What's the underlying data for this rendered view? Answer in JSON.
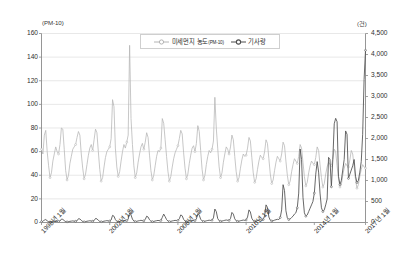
{
  "axes": {
    "left_unit": "(PM-10)",
    "right_unit": "(건)",
    "left_ticks": [
      "160",
      "140",
      "120",
      "100",
      "80",
      "60",
      "40",
      "20",
      "0"
    ],
    "right_ticks": [
      "4,500",
      "4,000",
      "3,500",
      "3,000",
      "2,500",
      "2,000",
      "1,500",
      "1,000",
      "500",
      "0"
    ],
    "x_ticks": [
      "1998년 1월",
      "2002년 1월",
      "2006년 1월",
      "2010년 1월",
      "2014년 1월",
      "2017년 1월"
    ]
  },
  "legend": {
    "entries": [
      {
        "label_main": "미세먼지 농도",
        "label_sub": "(PM-10)",
        "color": "#b4b4b4",
        "marker": "circle-open"
      },
      {
        "label_main": "기사량",
        "label_sub": "",
        "color": "#4a4a4a",
        "marker": "circle-open"
      }
    ]
  },
  "colors": {
    "pm10_line": "#b4b4b4",
    "article_line": "#4d4d4d",
    "grid": "#d9d9d9",
    "axis": "#8a8a8a",
    "background": "#ffffff"
  },
  "chart_data": {
    "type": "line",
    "title": "",
    "xlabel": "",
    "ylabel": "(PM-10)",
    "y2label": "(건)",
    "ylim": [
      0,
      160
    ],
    "y2lim": [
      0,
      4500
    ],
    "grid": true,
    "legend_position": "top-center",
    "x_tick_labels": [
      "1998년 1월",
      "2002년 1월",
      "2006년 1월",
      "2010년 1월",
      "2014년 1월",
      "2017년 1월"
    ],
    "x_tick_indices": [
      0,
      48,
      96,
      144,
      192,
      228
    ],
    "x_start": "1998-01",
    "x_end": "2017-01",
    "n_points": 229,
    "series": [
      {
        "name": "미세먼지 농도(PM-10)",
        "axis": "left",
        "unit": "㎍/㎥",
        "color": "#b4b4b4",
        "values": [
          62,
          58,
          74,
          78,
          60,
          48,
          38,
          42,
          52,
          58,
          64,
          60,
          58,
          66,
          80,
          79,
          62,
          44,
          36,
          40,
          50,
          56,
          62,
          64,
          66,
          72,
          77,
          74,
          58,
          46,
          37,
          41,
          49,
          57,
          63,
          66,
          61,
          70,
          79,
          76,
          60,
          45,
          35,
          38,
          47,
          55,
          60,
          62,
          64,
          71,
          104,
          98,
          63,
          47,
          39,
          43,
          52,
          60,
          66,
          63,
          68,
          74,
          150,
          88,
          66,
          48,
          38,
          42,
          51,
          58,
          64,
          67,
          62,
          68,
          76,
          72,
          57,
          44,
          36,
          40,
          48,
          56,
          61,
          60,
          63,
          88,
          84,
          70,
          56,
          43,
          35,
          39,
          47,
          54,
          59,
          62,
          65,
          71,
          78,
          75,
          59,
          46,
          37,
          41,
          50,
          57,
          63,
          65,
          60,
          67,
          82,
          77,
          61,
          45,
          36,
          40,
          49,
          56,
          61,
          59,
          62,
          69,
          106,
          80,
          63,
          47,
          38,
          42,
          51,
          58,
          64,
          62,
          58,
          64,
          74,
          70,
          56,
          43,
          35,
          38,
          46,
          53,
          58,
          56,
          57,
          63,
          72,
          69,
          55,
          42,
          34,
          37,
          45,
          52,
          57,
          55,
          54,
          60,
          70,
          67,
          54,
          41,
          33,
          36,
          44,
          51,
          56,
          54,
          52,
          58,
          68,
          65,
          52,
          40,
          32,
          35,
          43,
          49,
          54,
          52,
          50,
          56,
          66,
          63,
          51,
          39,
          31,
          34,
          42,
          48,
          52,
          50,
          49,
          55,
          64,
          61,
          49,
          38,
          30,
          33,
          41,
          47,
          51,
          49,
          48,
          54,
          62,
          60,
          48,
          37,
          30,
          32,
          40,
          46,
          50,
          48,
          47,
          53,
          61,
          58,
          47,
          36,
          29,
          32,
          39,
          45,
          49,
          47,
          46
        ]
      },
      {
        "name": "기사량",
        "axis": "right",
        "unit": "건",
        "color": "#4d4d4d",
        "values": [
          20,
          25,
          60,
          70,
          40,
          20,
          15,
          18,
          25,
          30,
          35,
          30,
          25,
          35,
          80,
          75,
          45,
          22,
          16,
          20,
          28,
          33,
          38,
          32,
          28,
          40,
          90,
          85,
          50,
          25,
          18,
          22,
          30,
          36,
          42,
          35,
          30,
          45,
          95,
          88,
          52,
          26,
          19,
          23,
          32,
          38,
          44,
          38,
          35,
          60,
          170,
          150,
          70,
          30,
          20,
          25,
          35,
          42,
          48,
          40,
          45,
          80,
          230,
          180,
          80,
          35,
          22,
          28,
          38,
          45,
          52,
          45,
          40,
          70,
          150,
          130,
          65,
          32,
          21,
          26,
          36,
          43,
          50,
          42,
          48,
          120,
          200,
          140,
          70,
          34,
          22,
          27,
          37,
          44,
          51,
          44,
          50,
          90,
          180,
          160,
          75,
          36,
          24,
          29,
          39,
          46,
          53,
          46,
          45,
          85,
          210,
          175,
          78,
          38,
          25,
          30,
          40,
          48,
          55,
          48,
          55,
          110,
          320,
          260,
          95,
          42,
          28,
          33,
          44,
          52,
          60,
          52,
          50,
          95,
          240,
          200,
          88,
          40,
          27,
          32,
          43,
          50,
          58,
          50,
          60,
          130,
          300,
          250,
          100,
          45,
          30,
          36,
          48,
          56,
          64,
          56,
          70,
          160,
          420,
          360,
          130,
          55,
          36,
          42,
          56,
          66,
          76,
          70,
          120,
          300,
          900,
          760,
          280,
          110,
          70,
          85,
          120,
          150,
          200,
          230,
          350,
          700,
          1750,
          1500,
          600,
          230,
          150,
          180,
          260,
          340,
          420,
          500,
          700,
          1150,
          1450,
          1200,
          700,
          350,
          260,
          300,
          420,
          560,
          1550,
          1500,
          850,
          1500,
          2350,
          2480,
          2400,
          1100,
          900,
          1000,
          1250,
          1500,
          2180,
          2100,
          1050,
          1150,
          1250,
          1350,
          1500,
          1100,
          950,
          1000,
          1200,
          1450,
          2100,
          3400,
          4100
        ]
      }
    ]
  }
}
